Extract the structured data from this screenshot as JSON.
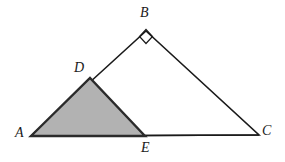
{
  "figure": {
    "kind": "geometry-diagram",
    "width": 285,
    "height": 162,
    "background_color": "#ffffff",
    "stroke_color": "#1a1a1a",
    "shaded_fill_color": "#b2b2b2",
    "shaded_stroke_color": "#2b2b2b"
  },
  "points": {
    "A": {
      "label": "A",
      "x": 31,
      "y": 136,
      "label_x": 15,
      "label_y": 126
    },
    "B": {
      "label": "B",
      "x": 146,
      "y": 31,
      "label_x": 140,
      "label_y": 6
    },
    "C": {
      "label": "C",
      "x": 259,
      "y": 135,
      "label_x": 262,
      "label_y": 124
    },
    "D": {
      "label": "D",
      "x": 90,
      "y": 78,
      "label_x": 74,
      "label_y": 61
    },
    "E": {
      "label": "E",
      "x": 145,
      "y": 136,
      "label_x": 141,
      "label_y": 141
    }
  },
  "shapes": {
    "outer_triangle": {
      "name": "triangle ABC",
      "vertices": "A,B,C",
      "points_attr": "31,136 146,31 259,135",
      "fill": "none",
      "stroke": "#1a1a1a",
      "stroke_width": 1.6
    },
    "shaded_triangle": {
      "name": "triangle ADE",
      "vertices": "A,D,E",
      "points_attr": "31,136 90,78 145,136",
      "fill": "#b2b2b2",
      "stroke": "#2b2b2b",
      "stroke_width": 2.4
    },
    "base_line": {
      "name": "segment AC",
      "x1": 31,
      "y1": 136,
      "x2": 259,
      "y2": 135,
      "stroke": "#1a1a1a",
      "stroke_width": 1.4
    },
    "right_angle_marker": {
      "name": "right angle at B",
      "at_vertex": "B",
      "points_attr": "146,29.5 152.5,36.5 146,43.5 139.5,36.5",
      "fill": "none",
      "stroke": "#1a1a1a",
      "stroke_width": 1.2
    }
  },
  "labels": {
    "a": "A",
    "b": "B",
    "c": "C",
    "d": "D",
    "e": "E"
  }
}
